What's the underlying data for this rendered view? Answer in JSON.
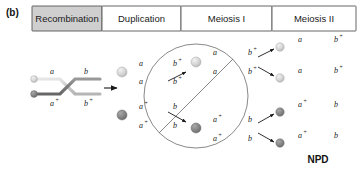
{
  "figure": {
    "letter": "(b)",
    "result_label": "NPD"
  },
  "header": {
    "panels": [
      {
        "label": "Recombination",
        "active": true
      },
      {
        "label": "Duplication",
        "active": false
      },
      {
        "label": "Meiosis I",
        "active": false
      },
      {
        "label": "Meiosis II",
        "active": false
      }
    ]
  },
  "colors": {
    "light_chromatid": "#c9c9c9",
    "dark_chromatid": "#7d7d7d",
    "light_centromere": "#d8d8d8",
    "dark_centromere": "#8a8a8a",
    "outline": "#6b6b6b",
    "header_active_bg": "#cfcfcf",
    "header_bg": "#ffffff",
    "text": "#1a1a1a"
  },
  "recombination": {
    "top_chromosome": {
      "left_allele": "a",
      "right_allele": "b",
      "left_sup": "",
      "right_sup": ""
    },
    "bottom_chromosome": {
      "left_allele": "a",
      "right_allele": "b",
      "left_sup": "+",
      "right_sup": "+"
    },
    "arrow": "right-arrow"
  },
  "duplication": {
    "top_bivalent": {
      "labels": [
        {
          "allele": "a",
          "sup": ""
        },
        {
          "allele": "b",
          "sup": "+"
        },
        {
          "allele": "a",
          "sup": ""
        },
        {
          "allele": "b",
          "sup": "+"
        }
      ]
    },
    "bottom_bivalent": {
      "labels": [
        {
          "allele": "a",
          "sup": "+"
        },
        {
          "allele": "b",
          "sup": ""
        },
        {
          "allele": "a",
          "sup": "+"
        },
        {
          "allele": "b",
          "sup": ""
        }
      ]
    }
  },
  "meiosis_one": {
    "top_dyad": {
      "labels": [
        {
          "allele": "a",
          "sup": ""
        },
        {
          "allele": "b",
          "sup": "+"
        },
        {
          "allele": "a",
          "sup": ""
        },
        {
          "allele": "b",
          "sup": "+"
        }
      ]
    },
    "bottom_dyad": {
      "labels": [
        {
          "allele": "a",
          "sup": "+"
        },
        {
          "allele": "b",
          "sup": ""
        },
        {
          "allele": "a",
          "sup": "+"
        },
        {
          "allele": "b",
          "sup": ""
        }
      ]
    }
  },
  "meiosis_two": {
    "products": [
      {
        "left_allele": "a",
        "left_sup": "",
        "right_allele": "b",
        "right_sup": "+"
      },
      {
        "left_allele": "a",
        "left_sup": "",
        "right_allele": "b",
        "right_sup": "+"
      },
      {
        "left_allele": "a",
        "left_sup": "+",
        "right_allele": "b",
        "right_sup": ""
      },
      {
        "left_allele": "a",
        "left_sup": "+",
        "right_allele": "b",
        "right_sup": ""
      }
    ]
  }
}
